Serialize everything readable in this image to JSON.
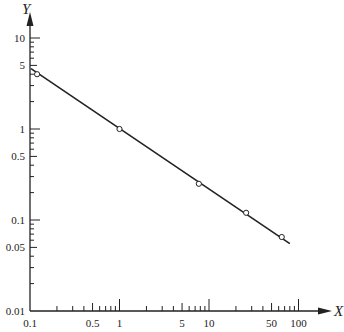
{
  "chart_data": {
    "type": "line",
    "title": "",
    "xlabel": "X",
    "ylabel": "Y",
    "xscale": "log",
    "yscale": "log",
    "xlim": [
      0.1,
      100
    ],
    "ylim": [
      0.01,
      10
    ],
    "grid": false,
    "legend": null,
    "x_tick_labels": [
      "0.1",
      "0.5",
      "1",
      "5",
      "10",
      "50",
      "100"
    ],
    "y_tick_labels": [
      "0.01",
      "0.05",
      "0.1",
      "0.5",
      "1",
      "5",
      "10"
    ],
    "series": [
      {
        "name": "fit line",
        "style": "solid",
        "x": [
          0.1,
          80
        ],
        "y": [
          4.6,
          0.055
        ]
      },
      {
        "name": "data points",
        "style": "open-circle",
        "x": [
          0.12,
          1,
          7.7,
          26,
          65
        ],
        "y": [
          4.0,
          1.0,
          0.25,
          0.12,
          0.065
        ]
      }
    ]
  },
  "colors": {
    "axis": "#222222",
    "line": "#222222",
    "background": "#ffffff"
  }
}
